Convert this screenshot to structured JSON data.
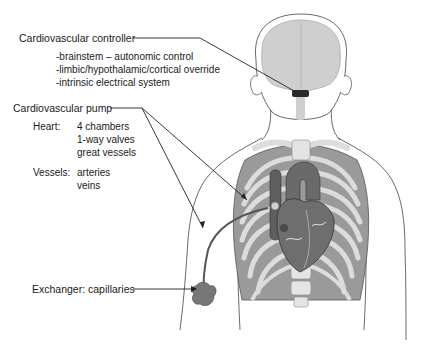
{
  "diagram": {
    "type": "anatomical-labeled-illustration",
    "colors": {
      "background": "#ffffff",
      "outline": "#333333",
      "brain": "#cfcfcf",
      "ribs": "#d9d9d9",
      "lung": "#8f8f8f",
      "heart": "#6e6e6e",
      "vessel": "#5a5a5a",
      "capillary": "#777777",
      "leader_line": "#222222"
    },
    "labels": {
      "controller": {
        "title": "Cardiovascular controller",
        "items": [
          "-brainstem – autonomic control",
          "-limbic/hypothalamic/cortical override",
          "-intrinsic electrical system"
        ]
      },
      "pump": {
        "title": "Cardiovascular pump",
        "heart_label": "Heart:",
        "heart_items": [
          "4 chambers",
          "1-way valves",
          "great vessels"
        ],
        "vessels_label": "Vessels:",
        "vessels_items": [
          "arteries",
          "veins"
        ]
      },
      "exchanger": {
        "title": "Exchanger: capillaries"
      }
    }
  }
}
